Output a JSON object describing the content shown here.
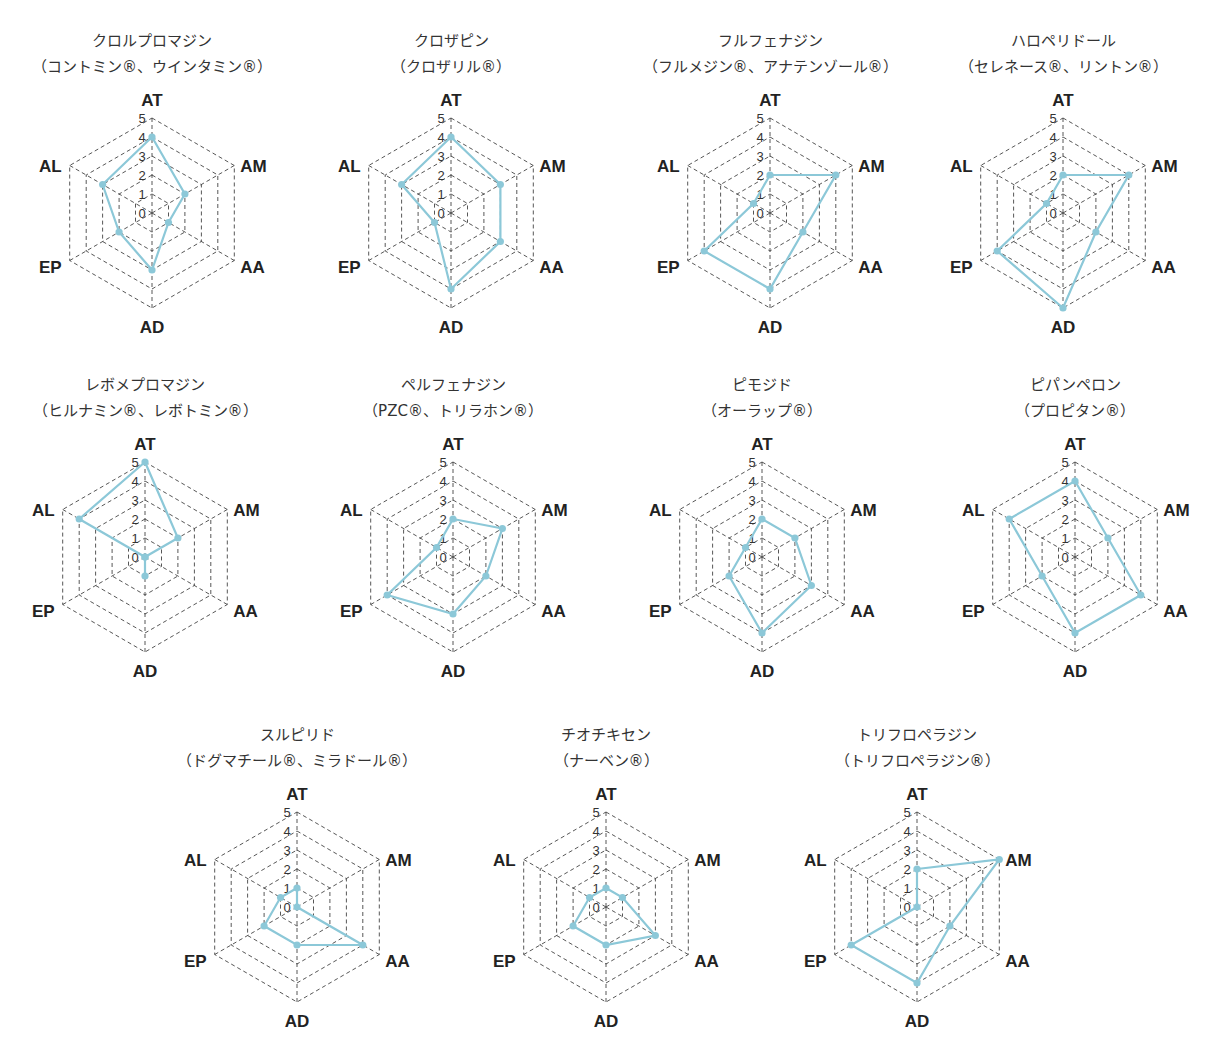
{
  "axes": [
    "AT",
    "AM",
    "AA",
    "AD",
    "EP",
    "AL"
  ],
  "scale": {
    "min": 0,
    "max": 5,
    "ticks": [
      "0",
      "1",
      "2",
      "3",
      "4",
      "5"
    ]
  },
  "colors": {
    "series_line": "#8cc8d8",
    "series_marker": "#8cc8d8",
    "grid": "#444444",
    "text": "#222222"
  },
  "chart_data": [
    {
      "type": "radar",
      "title": "クロルプロマジン",
      "subtitle": "（コントミン®、ウインタミン®）",
      "categories": [
        "AT",
        "AM",
        "AA",
        "AD",
        "EP",
        "AL"
      ],
      "values": [
        4,
        2,
        1,
        3,
        2,
        3
      ],
      "ylim": [
        0,
        5
      ],
      "grid": true
    },
    {
      "type": "radar",
      "title": "クロザピン",
      "subtitle": "（クロザリル®）",
      "categories": [
        "AT",
        "AM",
        "AA",
        "AD",
        "EP",
        "AL"
      ],
      "values": [
        4,
        3,
        3,
        4,
        1,
        3
      ],
      "ylim": [
        0,
        5
      ],
      "grid": true
    },
    {
      "type": "radar",
      "title": "フルフェナジン",
      "subtitle": "（フルメジン®、アナテンゾール®）",
      "categories": [
        "AT",
        "AM",
        "AA",
        "AD",
        "EP",
        "AL"
      ],
      "values": [
        2,
        4,
        2,
        4,
        4,
        1
      ],
      "ylim": [
        0,
        5
      ],
      "grid": true
    },
    {
      "type": "radar",
      "title": "ハロペリドール",
      "subtitle": "（セレネース®、リントン®）",
      "categories": [
        "AT",
        "AM",
        "AA",
        "AD",
        "EP",
        "AL"
      ],
      "values": [
        2,
        4,
        2,
        5,
        4,
        1
      ],
      "ylim": [
        0,
        5
      ],
      "grid": true
    },
    {
      "type": "radar",
      "title": "レボメプロマジン",
      "subtitle": "（ヒルナミン®、レボトミン®）",
      "categories": [
        "AT",
        "AM",
        "AA",
        "AD",
        "EP",
        "AL"
      ],
      "values": [
        5,
        2,
        0,
        1,
        0,
        4
      ],
      "ylim": [
        0,
        5
      ],
      "grid": true
    },
    {
      "type": "radar",
      "title": "ペルフェナジン",
      "subtitle": "（PZC®、トリラホン®）",
      "categories": [
        "AT",
        "AM",
        "AA",
        "AD",
        "EP",
        "AL"
      ],
      "values": [
        2,
        3,
        2,
        3,
        4,
        1
      ],
      "ylim": [
        0,
        5
      ],
      "grid": true
    },
    {
      "type": "radar",
      "title": "ピモジド",
      "subtitle": "（オーラップ®）",
      "categories": [
        "AT",
        "AM",
        "AA",
        "AD",
        "EP",
        "AL"
      ],
      "values": [
        2,
        2,
        3,
        4,
        2,
        1
      ],
      "ylim": [
        0,
        5
      ],
      "grid": true
    },
    {
      "type": "radar",
      "title": "ピパンペロン",
      "subtitle": "（プロピタン®）",
      "categories": [
        "AT",
        "AM",
        "AA",
        "AD",
        "EP",
        "AL"
      ],
      "values": [
        4,
        2,
        4,
        4,
        2,
        4
      ],
      "ylim": [
        0,
        5
      ],
      "grid": true
    },
    {
      "type": "radar",
      "title": "スルピリド",
      "subtitle": "（ドグマチール®、ミラドール®）",
      "categories": [
        "AT",
        "AM",
        "AA",
        "AD",
        "EP",
        "AL"
      ],
      "values": [
        1,
        0,
        4,
        2,
        2,
        1
      ],
      "ylim": [
        0,
        5
      ],
      "grid": true
    },
    {
      "type": "radar",
      "title": "チオチキセン",
      "subtitle": "（ナーベン®）",
      "categories": [
        "AT",
        "AM",
        "AA",
        "AD",
        "EP",
        "AL"
      ],
      "values": [
        1,
        1,
        3,
        2,
        2,
        1
      ],
      "ylim": [
        0,
        5
      ],
      "grid": true
    },
    {
      "type": "radar",
      "title": "トリフロペラジン",
      "subtitle": "（トリフロペラジン®）",
      "categories": [
        "AT",
        "AM",
        "AA",
        "AD",
        "EP",
        "AL"
      ],
      "values": [
        2,
        5,
        2,
        4,
        4,
        0
      ],
      "ylim": [
        0,
        5
      ],
      "grid": true
    }
  ]
}
